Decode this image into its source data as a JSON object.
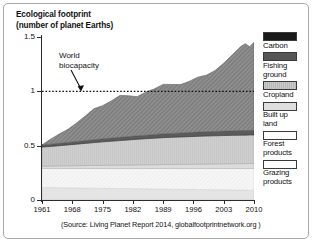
{
  "title": "Ecological footprint\n(number of planet Earths)",
  "annotation": {
    "label": "World\nbiocapacity",
    "line_value": 1
  },
  "source": "(Source: Living Planet Report 2014, globalfootprintnetwork.org )",
  "axes": {
    "y_ticks": [
      "1.5",
      "1",
      "0.5",
      "0"
    ],
    "y_values": [
      1.5,
      1.0,
      0.5,
      0.0
    ],
    "x_ticks": [
      "1961",
      "1968",
      "1975",
      "1982",
      "1989",
      "1996",
      "2003",
      "2010"
    ],
    "x_values": [
      1961,
      1968,
      1975,
      1982,
      1989,
      1996,
      2003,
      2010
    ]
  },
  "legend": [
    {
      "label": "Carbon",
      "color": "#1a1a1a"
    },
    {
      "label": "Fishing\nground",
      "color": "#565656"
    },
    {
      "label": "Cropland",
      "color": "#c4c4c4"
    },
    {
      "label": "Built up\nland",
      "color": "#dedede"
    },
    {
      "label": "Forest\nproducts",
      "color": "#f4f4f4"
    },
    {
      "label": "Grazing\nproducts",
      "color": "#e8e8e8"
    }
  ],
  "chart_data": {
    "type": "area",
    "title": "Ecological footprint (number of planet Earths)",
    "xlabel": "",
    "ylabel": "number of planet Earths",
    "xlim": [
      1961,
      2010
    ],
    "ylim": [
      0,
      1.5
    ],
    "grid": false,
    "legend_position": "right",
    "stacked": true,
    "annotations": [
      {
        "text": "World biocapacity",
        "type": "dotted-hline",
        "y": 1.0
      }
    ],
    "x": [
      1961,
      1963,
      1965,
      1967,
      1969,
      1971,
      1973,
      1975,
      1977,
      1979,
      1981,
      1983,
      1985,
      1987,
      1989,
      1991,
      1993,
      1995,
      1997,
      1999,
      2001,
      2003,
      2005,
      2007,
      2008,
      2009,
      2010
    ],
    "series": [
      {
        "name": "Grazing products",
        "values": [
          0.115,
          0.114,
          0.113,
          0.112,
          0.111,
          0.11,
          0.109,
          0.108,
          0.107,
          0.106,
          0.105,
          0.104,
          0.103,
          0.102,
          0.101,
          0.1,
          0.099,
          0.098,
          0.097,
          0.096,
          0.095,
          0.094,
          0.093,
          0.092,
          0.091,
          0.09,
          0.09
        ]
      },
      {
        "name": "Forest products",
        "values": [
          0.175,
          0.176,
          0.177,
          0.178,
          0.179,
          0.18,
          0.181,
          0.182,
          0.183,
          0.184,
          0.185,
          0.186,
          0.187,
          0.188,
          0.189,
          0.19,
          0.191,
          0.192,
          0.193,
          0.194,
          0.195,
          0.196,
          0.197,
          0.198,
          0.199,
          0.2,
          0.2
        ]
      },
      {
        "name": "Built up land",
        "values": [
          0.022,
          0.023,
          0.024,
          0.025,
          0.026,
          0.027,
          0.028,
          0.029,
          0.03,
          0.031,
          0.032,
          0.033,
          0.034,
          0.035,
          0.036,
          0.037,
          0.038,
          0.039,
          0.04,
          0.041,
          0.042,
          0.043,
          0.044,
          0.045,
          0.045,
          0.046,
          0.046
        ]
      },
      {
        "name": "Cropland",
        "values": [
          0.175,
          0.18,
          0.186,
          0.192,
          0.198,
          0.204,
          0.21,
          0.216,
          0.221,
          0.226,
          0.231,
          0.236,
          0.24,
          0.244,
          0.248,
          0.25,
          0.252,
          0.254,
          0.256,
          0.258,
          0.259,
          0.26,
          0.261,
          0.262,
          0.262,
          0.263,
          0.263
        ]
      },
      {
        "name": "Fishing ground",
        "values": [
          0.02,
          0.021,
          0.022,
          0.023,
          0.025,
          0.026,
          0.027,
          0.028,
          0.029,
          0.03,
          0.031,
          0.032,
          0.033,
          0.034,
          0.035,
          0.036,
          0.037,
          0.038,
          0.039,
          0.04,
          0.04,
          0.041,
          0.041,
          0.042,
          0.042,
          0.042,
          0.042
        ]
      },
      {
        "name": "Carbon",
        "values": [
          0.0,
          0.046,
          0.085,
          0.12,
          0.17,
          0.225,
          0.285,
          0.305,
          0.34,
          0.385,
          0.375,
          0.36,
          0.395,
          0.42,
          0.455,
          0.45,
          0.445,
          0.47,
          0.505,
          0.52,
          0.56,
          0.625,
          0.7,
          0.775,
          0.8,
          0.77,
          0.81
        ]
      }
    ],
    "totals": [
      0.507,
      0.56,
      0.607,
      0.65,
      0.709,
      0.772,
      0.84,
      0.868,
      0.91,
      0.962,
      0.959,
      0.951,
      0.992,
      1.023,
      1.064,
      1.063,
      1.062,
      1.091,
      1.13,
      1.149,
      1.191,
      1.259,
      1.336,
      1.414,
      1.439,
      1.411,
      1.451
    ]
  }
}
